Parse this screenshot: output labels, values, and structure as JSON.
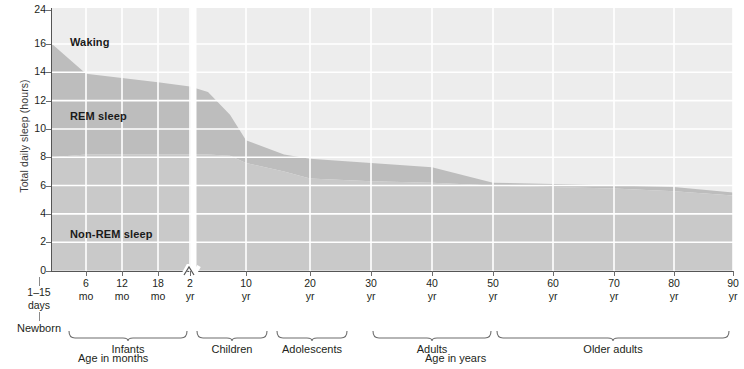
{
  "chart_data": {
    "type": "area",
    "title": "",
    "subtitle": "",
    "ylabel": "Total daily sleep (hours)",
    "xlabel_left": "Age in months",
    "xlabel_right": "Age in years",
    "ylim": [
      0,
      24
    ],
    "y_ticks": [
      0,
      2,
      4,
      6,
      8,
      10,
      12,
      14,
      16,
      24
    ],
    "y_axis_note": "Axis compressed between 16 and 24 hours",
    "grid": true,
    "grid_color": "#ffffff",
    "x_break_at": "2 yr",
    "x_ticks": [
      {
        "value": "6",
        "unit": "mo"
      },
      {
        "value": "12",
        "unit": "mo"
      },
      {
        "value": "18",
        "unit": "mo"
      },
      {
        "value": "2",
        "unit": "yr"
      },
      {
        "value": "10",
        "unit": "yr"
      },
      {
        "value": "20",
        "unit": "yr"
      },
      {
        "value": "30",
        "unit": "yr"
      },
      {
        "value": "40",
        "unit": "yr"
      },
      {
        "value": "50",
        "unit": "yr"
      },
      {
        "value": "60",
        "unit": "yr"
      },
      {
        "value": "70",
        "unit": "yr"
      },
      {
        "value": "80",
        "unit": "yr"
      },
      {
        "value": "90",
        "unit": "yr"
      }
    ],
    "newborn": {
      "range": "1–15",
      "unit": "days",
      "name": "Newborn"
    },
    "series": [
      {
        "name": "Waking",
        "color": "#ededed",
        "description": "Region above the total-sleep curve, from total sleep up to 24 hours"
      },
      {
        "name": "REM sleep",
        "color": "#bdbdbd",
        "description": "Band between the non-REM curve and the total-sleep curve",
        "points": [
          {
            "x": "newborn",
            "total": 16.0,
            "nonrem": 8.0
          },
          {
            "x": "6 mo",
            "total": 13.9,
            "nonrem": 8.2
          },
          {
            "x": "12 mo",
            "total": 13.6,
            "nonrem": 8.2
          },
          {
            "x": "18 mo",
            "total": 13.3,
            "nonrem": 8.2
          },
          {
            "x": "2 yr",
            "total": 13.0,
            "nonrem": 8.2
          },
          {
            "x": "3 yr",
            "total": 12.6,
            "nonrem": 8.2
          },
          {
            "x": "5 yr",
            "total": 11.0,
            "nonrem": 8.1
          },
          {
            "x": "10 yr",
            "total": 9.2,
            "nonrem": 7.6
          },
          {
            "x": "14 yr",
            "total": 8.2,
            "nonrem": 7.0
          },
          {
            "x": "20 yr",
            "total": 7.9,
            "nonrem": 6.5
          },
          {
            "x": "30 yr",
            "total": 7.6,
            "nonrem": 6.3
          },
          {
            "x": "40 yr",
            "total": 7.3,
            "nonrem": 6.2
          },
          {
            "x": "50 yr",
            "total": 6.2,
            "nonrem": 6.0
          },
          {
            "x": "60 yr",
            "total": 6.1,
            "nonrem": 5.9
          },
          {
            "x": "70 yr",
            "total": 6.0,
            "nonrem": 5.8
          },
          {
            "x": "80 yr",
            "total": 5.9,
            "nonrem": 5.6
          },
          {
            "x": "90 yr",
            "total": 5.5,
            "nonrem": 5.3
          }
        ]
      },
      {
        "name": "Non-REM sleep",
        "color": "#c9c9c9",
        "description": "Region from 0 hours up to the non-REM curve"
      }
    ],
    "region_labels": [
      {
        "name": "Waking",
        "x_px": 70,
        "y_px": 36
      },
      {
        "name": "REM sleep",
        "x_px": 70,
        "y_px": 110
      },
      {
        "name": "Non-REM sleep",
        "x_px": 70,
        "y_px": 228
      }
    ],
    "age_groups": [
      {
        "label": "Infants",
        "from": "1–15 days",
        "to": "2 yr"
      },
      {
        "label": "Children",
        "from": "2 yr",
        "to": "10 yr"
      },
      {
        "label": "Adolescents",
        "from": "10 yr",
        "to": "20 yr"
      },
      {
        "label": "Adults",
        "from": "30 yr",
        "to": "50 yr"
      },
      {
        "label": "Older adults",
        "from": "50 yr",
        "to": "90 yr"
      }
    ]
  },
  "colors": {
    "waking": "#ededed",
    "rem": "#bdbdbd",
    "nonrem": "#c9c9c9",
    "grid": "#ffffff",
    "axis": "#555555",
    "text": "#231f20"
  }
}
